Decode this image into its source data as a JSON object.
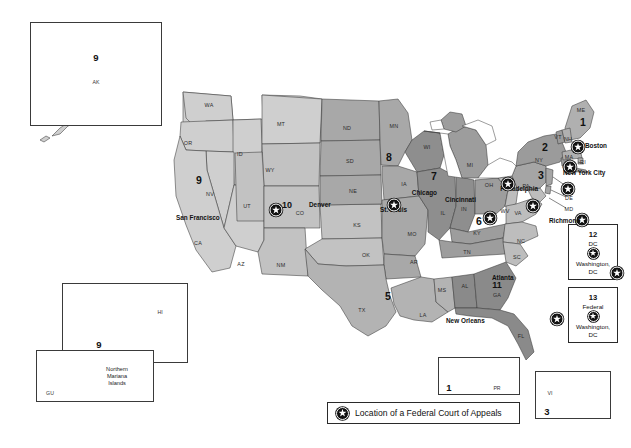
{
  "map": {
    "title": "United States Courts of Appeals Circuit Map",
    "legend": {
      "icon": "star-marker-icon",
      "text": "Location of a Federal Court of Appeals"
    },
    "colors": {
      "light": "#cfcfcf",
      "medium": "#b3b3b3",
      "dark": "#9a9a9a",
      "darker": "#868686",
      "outline": "#3a3a3a",
      "background": "#ffffff",
      "text": "#111111"
    },
    "circuits": [
      {
        "number": "1",
        "x": 583,
        "y": 122
      },
      {
        "number": "2",
        "x": 545,
        "y": 147
      },
      {
        "number": "3",
        "x": 541,
        "y": 175
      },
      {
        "number": "4",
        "x": 536,
        "y": 204
      },
      {
        "number": "5",
        "x": 388,
        "y": 296
      },
      {
        "number": "6",
        "x": 479,
        "y": 221
      },
      {
        "number": "7",
        "x": 434,
        "y": 176
      },
      {
        "number": "8",
        "x": 389,
        "y": 157
      },
      {
        "number": "9",
        "x": 199,
        "y": 180
      },
      {
        "number": "10",
        "x": 287,
        "y": 205
      },
      {
        "number": "11",
        "x": 497,
        "y": 285
      }
    ],
    "cities": [
      {
        "name": "Boston",
        "star_x": 578,
        "star_y": 146,
        "label_x": 585,
        "label_y": 145,
        "align": "left"
      },
      {
        "name": "New York City",
        "star_x": 557,
        "star_y": 166,
        "label_x": 563,
        "label_y": 172,
        "align": "left"
      },
      {
        "name": "Philadelphia",
        "star_x": 542,
        "star_y": 188,
        "label_x": 538,
        "label_y": 188,
        "align": "right"
      },
      {
        "name": "Richmond",
        "star_x": 543,
        "star_y": 219,
        "label_x": 549,
        "label_y": 220,
        "align": "left"
      },
      {
        "name": "Cincinnati",
        "star_x": 481,
        "star_y": 205,
        "label_x": 476,
        "label_y": 199,
        "align": "right"
      },
      {
        "name": "Chicago",
        "star_x": 443,
        "star_y": 183,
        "label_x": 437,
        "label_y": 192,
        "align": "right"
      },
      {
        "name": "St. Louis",
        "star_x": 412,
        "star_y": 217,
        "label_x": 407,
        "label_y": 209,
        "align": "right"
      },
      {
        "name": "Denver",
        "star_x": 303,
        "star_y": 204,
        "label_x": 309,
        "label_y": 204,
        "align": "left"
      },
      {
        "name": "San Francisco",
        "star_x": 172,
        "star_y": 209,
        "label_x": 176,
        "label_y": 217,
        "align": "left"
      },
      {
        "name": "New Orleans",
        "star_x": 440,
        "star_y": 318,
        "label_x": 446,
        "label_y": 320,
        "align": "left"
      },
      {
        "name": "Atlanta",
        "star_x": 487,
        "star_y": 272,
        "label_x": 492,
        "label_y": 277,
        "align": "left"
      }
    ],
    "states": [
      {
        "code": "WA",
        "x": 209,
        "y": 105
      },
      {
        "code": "OR",
        "x": 188,
        "y": 143
      },
      {
        "code": "ID",
        "x": 240,
        "y": 154
      },
      {
        "code": "MT",
        "x": 281,
        "y": 124
      },
      {
        "code": "WY",
        "x": 270,
        "y": 170
      },
      {
        "code": "NV",
        "x": 210,
        "y": 194
      },
      {
        "code": "UT",
        "x": 247,
        "y": 206
      },
      {
        "code": "CA",
        "x": 198,
        "y": 243
      },
      {
        "code": "AZ",
        "x": 241,
        "y": 264
      },
      {
        "code": "NM",
        "x": 281,
        "y": 265
      },
      {
        "code": "CO",
        "x": 300,
        "y": 213
      },
      {
        "code": "ND",
        "x": 347,
        "y": 128
      },
      {
        "code": "SD",
        "x": 350,
        "y": 161
      },
      {
        "code": "NE",
        "x": 353,
        "y": 191
      },
      {
        "code": "KS",
        "x": 357,
        "y": 225
      },
      {
        "code": "OK",
        "x": 366,
        "y": 255
      },
      {
        "code": "TX",
        "x": 362,
        "y": 310
      },
      {
        "code": "MN",
        "x": 394,
        "y": 126
      },
      {
        "code": "IA",
        "x": 404,
        "y": 184
      },
      {
        "code": "MO",
        "x": 412,
        "y": 234
      },
      {
        "code": "AR",
        "x": 414,
        "y": 262
      },
      {
        "code": "LA",
        "x": 423,
        "y": 315
      },
      {
        "code": "MS",
        "x": 442,
        "y": 290
      },
      {
        "code": "AL",
        "x": 465,
        "y": 286
      },
      {
        "code": "GA",
        "x": 497,
        "y": 295
      },
      {
        "code": "FL",
        "x": 521,
        "y": 336
      },
      {
        "code": "WI",
        "x": 427,
        "y": 147
      },
      {
        "code": "IL",
        "x": 443,
        "y": 213
      },
      {
        "code": "IN",
        "x": 464,
        "y": 209
      },
      {
        "code": "MI",
        "x": 470,
        "y": 165
      },
      {
        "code": "OH",
        "x": 489,
        "y": 185
      },
      {
        "code": "KY",
        "x": 477,
        "y": 233
      },
      {
        "code": "TN",
        "x": 467,
        "y": 252
      },
      {
        "code": "WV",
        "x": 505,
        "y": 211
      },
      {
        "code": "VA",
        "x": 518,
        "y": 213
      },
      {
        "code": "NC",
        "x": 521,
        "y": 241
      },
      {
        "code": "SC",
        "x": 517,
        "y": 257
      },
      {
        "code": "PA",
        "x": 526,
        "y": 186
      },
      {
        "code": "NY",
        "x": 539,
        "y": 160
      },
      {
        "code": "ME",
        "x": 581,
        "y": 110
      },
      {
        "code": "VT",
        "x": 558,
        "y": 137
      },
      {
        "code": "NH",
        "x": 568,
        "y": 139
      },
      {
        "code": "MA",
        "x": 569,
        "y": 157
      },
      {
        "code": "CT",
        "x": 566,
        "y": 167
      },
      {
        "code": "RI",
        "x": 583,
        "y": 162
      }
    ],
    "leader_labels": [
      {
        "code": "NJ",
        "x": 569,
        "y": 186
      },
      {
        "code": "DE",
        "x": 569,
        "y": 198
      },
      {
        "code": "MD",
        "x": 569,
        "y": 209
      }
    ],
    "insets": [
      {
        "id": "alaska",
        "number": "9",
        "code": "AK",
        "x": 30,
        "y": 22,
        "w": 132,
        "h": 104
      },
      {
        "id": "hawaii",
        "number": "9",
        "code": "HI",
        "x": 62,
        "y": 283,
        "w": 126,
        "h": 80
      },
      {
        "id": "mariana",
        "number": "",
        "code": "GU",
        "x": 36,
        "y": 350,
        "w": 118,
        "h": 52,
        "caption": "Northern\nMariana\nIslands"
      },
      {
        "id": "puerto-rico",
        "number": "1",
        "code": "PR",
        "x": 438,
        "y": 357,
        "w": 82,
        "h": 38
      },
      {
        "id": "virgin-islands",
        "number": "3",
        "code": "VI",
        "x": 535,
        "y": 371,
        "w": 76,
        "h": 48
      }
    ],
    "dc_boxes": [
      {
        "number": "12",
        "sub": "DC",
        "icon": "star-marker-icon",
        "city_line1": "Washington,",
        "city_line2": "DC",
        "x": 568,
        "y": 224,
        "w": 50,
        "h": 56
      },
      {
        "number": "13",
        "sub": "Federal",
        "icon": "star-marker-icon",
        "city_line1": "Washington,",
        "city_line2": "DC",
        "x": 568,
        "y": 287,
        "w": 50,
        "h": 56
      }
    ],
    "legend_box": {
      "x": 327,
      "y": 402,
      "w": 193,
      "h": 22
    }
  }
}
